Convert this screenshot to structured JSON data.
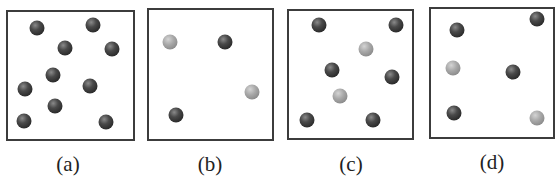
{
  "figure": {
    "panels": [
      {
        "id": "a",
        "label": "(a)",
        "box": {
          "left": 6,
          "top": 10,
          "right": 135,
          "bottom": 141
        },
        "label_pos": {
          "x": 68,
          "y": 152
        },
        "particles": [
          {
            "x": 37,
            "y": 28,
            "type": "dark"
          },
          {
            "x": 93,
            "y": 25,
            "type": "dark"
          },
          {
            "x": 65,
            "y": 48,
            "type": "dark"
          },
          {
            "x": 112,
            "y": 49,
            "type": "dark"
          },
          {
            "x": 53,
            "y": 75,
            "type": "dark"
          },
          {
            "x": 25,
            "y": 89,
            "type": "dark"
          },
          {
            "x": 90,
            "y": 86,
            "type": "dark"
          },
          {
            "x": 55,
            "y": 106,
            "type": "dark"
          },
          {
            "x": 24,
            "y": 121,
            "type": "dark"
          },
          {
            "x": 106,
            "y": 122,
            "type": "dark"
          }
        ]
      },
      {
        "id": "b",
        "label": "(b)",
        "box": {
          "left": 147,
          "top": 8,
          "right": 274,
          "bottom": 141
        },
        "label_pos": {
          "x": 210,
          "y": 152
        },
        "particles": [
          {
            "x": 170,
            "y": 42,
            "type": "light"
          },
          {
            "x": 225,
            "y": 42,
            "type": "dark"
          },
          {
            "x": 252,
            "y": 92,
            "type": "light"
          },
          {
            "x": 176,
            "y": 115,
            "type": "dark"
          }
        ]
      },
      {
        "id": "c",
        "label": "(c)",
        "box": {
          "left": 287,
          "top": 9,
          "right": 414,
          "bottom": 140
        },
        "label_pos": {
          "x": 351,
          "y": 152
        },
        "particles": [
          {
            "x": 319,
            "y": 25,
            "type": "dark"
          },
          {
            "x": 396,
            "y": 25,
            "type": "dark"
          },
          {
            "x": 366,
            "y": 49,
            "type": "light"
          },
          {
            "x": 332,
            "y": 70,
            "type": "dark"
          },
          {
            "x": 392,
            "y": 77,
            "type": "dark"
          },
          {
            "x": 340,
            "y": 96,
            "type": "light"
          },
          {
            "x": 307,
            "y": 120,
            "type": "dark"
          },
          {
            "x": 373,
            "y": 120,
            "type": "dark"
          }
        ]
      },
      {
        "id": "d",
        "label": "(d)",
        "box": {
          "left": 429,
          "top": 7,
          "right": 555,
          "bottom": 139
        },
        "label_pos": {
          "x": 492,
          "y": 150
        },
        "particles": [
          {
            "x": 457,
            "y": 30,
            "type": "dark"
          },
          {
            "x": 537,
            "y": 19,
            "type": "dark"
          },
          {
            "x": 453,
            "y": 68,
            "type": "light"
          },
          {
            "x": 513,
            "y": 72,
            "type": "dark"
          },
          {
            "x": 454,
            "y": 113,
            "type": "dark"
          },
          {
            "x": 537,
            "y": 118,
            "type": "light"
          }
        ]
      }
    ],
    "colors": {
      "border": "#3c3c3c",
      "dark_particle": "#333333",
      "light_particle": "#9a9a9a",
      "label": "#222222"
    }
  }
}
